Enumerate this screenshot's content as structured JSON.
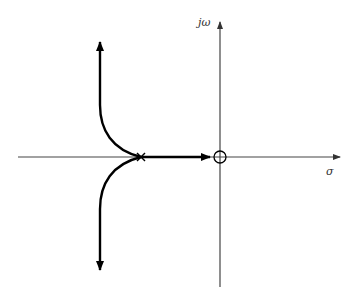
{
  "diagram": {
    "type": "root-locus",
    "axes": {
      "real_label": "σ",
      "imag_label": "jω",
      "origin": [
        220,
        157
      ],
      "real_axis": {
        "x_start": 18,
        "x_end": 340,
        "y": 157
      },
      "imag_axis": {
        "x": 220,
        "y_top": 22,
        "y_bottom": 287
      }
    },
    "pole": {
      "symbol": "×",
      "x": 141,
      "y": 157
    },
    "zero": {
      "symbol": "○",
      "x": 220,
      "y": 157,
      "r": 6
    },
    "branches": [
      {
        "name": "real-axis-branch",
        "from": [
          141,
          157
        ],
        "to": [
          210,
          157
        ],
        "direction": "toward zero"
      },
      {
        "name": "upper-asymptote-branch",
        "from": [
          141,
          157
        ],
        "to": [
          100,
          42
        ],
        "direction": "up"
      },
      {
        "name": "lower-asymptote-branch",
        "from": [
          141,
          157
        ],
        "to": [
          100,
          270
        ],
        "direction": "down"
      }
    ],
    "colors": {
      "axis": "#444444",
      "locus": "#000000",
      "background": "#ffffff"
    }
  }
}
